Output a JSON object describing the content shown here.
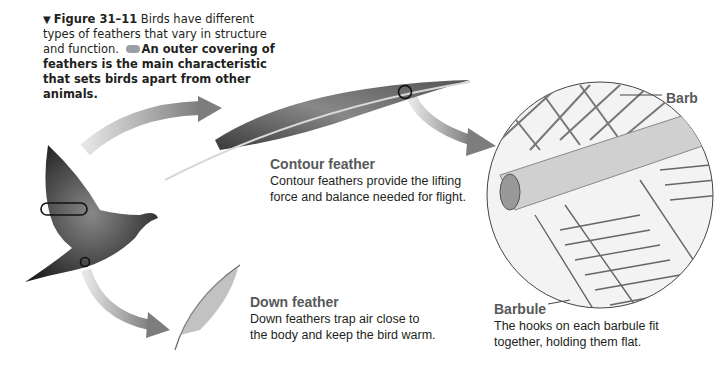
{
  "caption": {
    "figure_label": "Figure 31–11",
    "plain_text": "Birds have different types of feathers that vary in structure and function.",
    "key_icon": "key-concept-icon",
    "bold_text": "An outer covering of feathers is the main characteristic that sets birds apart from other animals."
  },
  "contour": {
    "title": "Contour feather",
    "line1": "Contour feathers provide the lifting",
    "line2": "force and balance needed for flight."
  },
  "down": {
    "title": "Down feather",
    "line1": "Down feathers trap air close to",
    "line2": "the body and keep the bird warm."
  },
  "barbule": {
    "title": "Barbule",
    "line1": "The hooks on each barbule fit",
    "line2": "together, holding them flat."
  },
  "barb": {
    "label": "Barb"
  },
  "colors": {
    "arrow": "#8c8c8c",
    "label_gray": "#58595b",
    "text": "#231f20"
  }
}
